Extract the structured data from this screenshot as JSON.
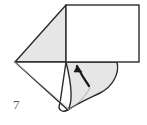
{
  "figure": {
    "kind": "origami-fold-diagram",
    "step_number": "7",
    "width": 147,
    "height": 125,
    "background_color": "#ffffff",
    "ink_color": "#2b2b2b",
    "shaded_face_color": "#e6e6e6",
    "white_face_color": "#ffffff",
    "soft_edge_color": "#a9a9a9",
    "arrow_color": "#1a1a1a"
  },
  "shapes": {
    "shaded_triangle": {
      "name": "shaded-left-triangle",
      "fill": "#e6e6e6",
      "stroke": "#2b2b2b",
      "stroke_width": 1.4,
      "points": "66,5 66,62 15,62"
    },
    "white_rectangle": {
      "name": "white-rectangle-panel",
      "fill": "#ffffff",
      "stroke": "#2b2b2b",
      "stroke_width": 1.4,
      "x": 66,
      "y": 5,
      "width": 73,
      "height": 57
    },
    "lower_left_fold": {
      "name": "lower-left-white-flap",
      "fill": "#ffffff",
      "stroke": "#2b2b2b",
      "stroke_width": 1.4,
      "path": "M15,62 L68,110 C62,113 57,110 60,103 L66,62 Z"
    },
    "lower_right_flap": {
      "name": "lower-right-shaded-flap",
      "fill": "#e6e6e6",
      "stroke": "#2b2b2b",
      "stroke_width": 1.4,
      "path": "M66,62 L117,62 C120,74 112,87 100,93 C90,98 78,103 68,110 C74,100 70,78 66,62 Z"
    },
    "soft_crease": {
      "name": "soft-crease-line",
      "stroke": "#b4b4b4",
      "stroke_width": 0.8,
      "path": "M15,62 L69,109"
    },
    "flap_inner_curve": {
      "name": "flap-inner-curve",
      "stroke": "#8c8c8c",
      "stroke_width": 0.8,
      "path": "M68,110 C76,106 84,98 90,88"
    },
    "fold_arrow": {
      "name": "curved-fold-arrow",
      "fill": "#1a1a1a",
      "stroke": "#1a1a1a",
      "stroke_width": 1.2,
      "path": "M89,86 C84,79 80,72 77,66",
      "head_points": "77,66 82,72 74,72"
    }
  },
  "labels": {
    "step": "7"
  }
}
